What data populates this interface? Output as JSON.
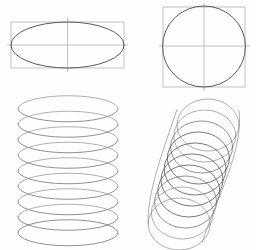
{
  "page": {
    "background_color": "#fefefe",
    "width": 256,
    "height": 250
  },
  "styles": {
    "construction_line_color": "#a8a8a8",
    "outline_color": "#4a4a4a",
    "coil_color": "#6b6b6b",
    "coil_color_dark": "#555555",
    "coil_color_light": "#8d8d8d"
  },
  "figures": [
    {
      "id": "ellipse-in-rectangle",
      "name": "Flat ellipse inscribed in rectangle with center axes",
      "type": "ellipse",
      "position": "top-left",
      "rectangle": {
        "x": 11,
        "y": 22,
        "width": 113,
        "height": 46
      },
      "ellipse": {
        "cx": 67.5,
        "cy": 45,
        "rx": 56.5,
        "ry": 23
      },
      "axes": {
        "vertical_x": 67.5,
        "vertical_y1": 18,
        "vertical_y2": 72,
        "horizontal_y": 45,
        "horizontal_x1": 7,
        "horizontal_x2": 128
      }
    },
    {
      "id": "circle-in-square",
      "name": "Circle inscribed in square with center axes",
      "type": "circle",
      "position": "top-right",
      "square": {
        "x": 163,
        "y": 7,
        "width": 82,
        "height": 80
      },
      "circle": {
        "cx": 204,
        "cy": 46,
        "r": 41
      },
      "axes": {
        "vertical_x": 204,
        "vertical_y1": 3,
        "vertical_y2": 91,
        "horizontal_y": 46,
        "horizontal_x1": 159,
        "horizontal_x2": 250
      }
    },
    {
      "id": "extended-coil",
      "name": "Extended helical coil spring of stacked ellipses",
      "type": "helix",
      "position": "bottom-left",
      "turns": 9,
      "ellipse_rx": 50,
      "ellipse_ry": 13,
      "center_x": 68,
      "top_y": 108,
      "pitch": 15.5
    },
    {
      "id": "compressed-coil",
      "name": "Compressed tilted coil spring of overlapping circles",
      "type": "helix",
      "position": "bottom-right",
      "turns": 10,
      "ellipse_rx": 31,
      "ellipse_ry": 26,
      "top_center_x": 208,
      "top_y": 125,
      "pitch": 11,
      "horizontal_drift": -3.2
    }
  ]
}
